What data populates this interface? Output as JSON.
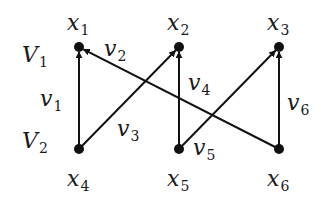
{
  "diagram": {
    "type": "bipartite-directed-graph",
    "partitions": [
      {
        "id": "V1",
        "label": "V",
        "sub": "1",
        "x": 22,
        "y": 62
      },
      {
        "id": "V2",
        "label": "V",
        "sub": "2",
        "x": 22,
        "y": 148
      }
    ],
    "nodes": [
      {
        "id": "x1",
        "label": "x",
        "sub": "1",
        "cx": 79,
        "cy": 47,
        "lx": 67,
        "ly": 30
      },
      {
        "id": "x2",
        "label": "x",
        "sub": "2",
        "cx": 179,
        "cy": 47,
        "lx": 167,
        "ly": 30
      },
      {
        "id": "x3",
        "label": "x",
        "sub": "3",
        "cx": 279,
        "cy": 47,
        "lx": 267,
        "ly": 30
      },
      {
        "id": "x4",
        "label": "x",
        "sub": "4",
        "cx": 79,
        "cy": 149,
        "lx": 67,
        "ly": 186
      },
      {
        "id": "x5",
        "label": "x",
        "sub": "5",
        "cx": 179,
        "cy": 149,
        "lx": 167,
        "ly": 186
      },
      {
        "id": "x6",
        "label": "x",
        "sub": "6",
        "cx": 279,
        "cy": 149,
        "lx": 267,
        "ly": 186
      }
    ],
    "edges": [
      {
        "id": "v1",
        "label": "v",
        "sub": "1",
        "from": "x4",
        "to": "x1",
        "lx": 40,
        "ly": 106
      },
      {
        "id": "v2",
        "label": "v",
        "sub": "2",
        "from": "x6",
        "to": "x1",
        "lx": 104,
        "ly": 56
      },
      {
        "id": "v3",
        "label": "v",
        "sub": "3",
        "from": "x4",
        "to": "x2",
        "lx": 117,
        "ly": 136
      },
      {
        "id": "v4",
        "label": "v",
        "sub": "4",
        "from": "x5",
        "to": "x2",
        "lx": 188,
        "ly": 90
      },
      {
        "id": "v5",
        "label": "v",
        "sub": "5",
        "from": "x5",
        "to": "x3",
        "lx": 193,
        "ly": 155
      },
      {
        "id": "v6",
        "label": "v",
        "sub": "6",
        "from": "x6",
        "to": "x3",
        "lx": 287,
        "ly": 110
      }
    ],
    "colors": {
      "stroke": "#111111",
      "text": "#1a1a1a",
      "background": "#ffffff"
    }
  }
}
